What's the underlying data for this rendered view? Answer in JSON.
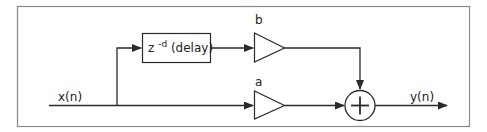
{
  "diagram": {
    "type": "signal-flow / block diagram (comb filter)",
    "input_label": "x(n)",
    "output_label": "y(n)",
    "delay_block": {
      "base": "z",
      "exponent": "-d",
      "suffix": " (delay)"
    },
    "gain_top_label": "b",
    "gain_bottom_label": "a",
    "summer_symbol": "+",
    "colors": {
      "stroke": "#2a2a2a",
      "frame": "#8a8a8a",
      "background": "#ffffff"
    }
  }
}
